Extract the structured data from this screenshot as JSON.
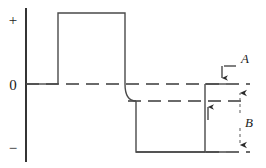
{
  "figure": {
    "kind": "waveform-diagram",
    "width": 266,
    "height": 168,
    "background": "#ffffff",
    "stroke_color": "#3a3a3a",
    "axis_color": "#2b2b2b",
    "label_color": "#1a1a1a"
  },
  "axis": {
    "vertical_x": 26,
    "top_label": "+",
    "zero_label": "0",
    "bottom_label": "−",
    "top_label_y": 20,
    "zero_label_y": 84,
    "bottom_label_y": 148
  },
  "levels": {
    "positive_top_y": 13,
    "zero_y": 84,
    "intermediate_y": 101,
    "negative_bottom_y": 152
  },
  "waveform": {
    "baseline_start_x": 26,
    "pulse_rise_x": 58,
    "pulse_fall_x": 125,
    "curve_end_x": 136,
    "negative_start_x": 136,
    "negative_end_x": 205,
    "trace_end_x": 226
  },
  "dashed_lines": [
    {
      "name": "zero-reference-line",
      "y": 84,
      "x1": 26,
      "x2": 250
    },
    {
      "name": "intermediate-reference-line",
      "y": 101,
      "x1": 128,
      "x2": 248
    },
    {
      "name": "bottom-reference-line",
      "y": 152,
      "x1": 205,
      "x2": 250
    }
  ],
  "annotations": {
    "a": {
      "label": "A",
      "label_x": 243,
      "label_y": 63,
      "leader_from_x": 236,
      "leader_from_y": 66,
      "leader_to_x": 222,
      "leader_to_y": 66,
      "arrow_x": 222,
      "arrow_top_y": 66,
      "arrow_tip_y": 83,
      "description": "downward arrow pointing at zero reference line"
    },
    "b": {
      "label": "B",
      "label_x": 248,
      "label_y": 123,
      "arrow_x": 240,
      "arrow_top_y": 86,
      "arrow_bottom_y": 151,
      "description": "double-headed dashed dimension arrow spanning zero line to bottom line"
    },
    "inner_arrow": {
      "name": "intermediate-level-arrow",
      "x": 208,
      "tip_y": 103,
      "tail_y": 120,
      "description": "upward arrow pointing at intermediate reference line"
    }
  }
}
